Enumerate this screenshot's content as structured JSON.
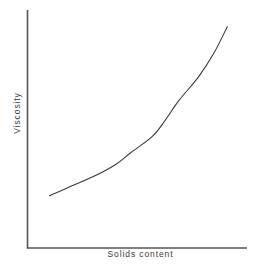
{
  "figure": {
    "background_color": "#ffffff",
    "axis_color": "#555555",
    "curve_color": "#3a3a3a",
    "label_color": "#3b3b3b"
  },
  "labels": {
    "y_axis": "Viscosity",
    "x_axis": "Solids content"
  },
  "chart_data": {
    "type": "line",
    "title": "",
    "subtitle": "",
    "xlabel": "Solids content",
    "ylabel": "Viscosity",
    "legend": [],
    "legend_position": "none",
    "grid": false,
    "axis_ticks": false,
    "tick_labels": [],
    "xlim": [
      0,
      1
    ],
    "ylim": [
      0,
      1
    ],
    "annotations": [],
    "series": [
      {
        "name": "Viscosity vs solids content",
        "x": [
          0.1,
          0.2,
          0.3,
          0.4,
          0.47,
          0.57,
          0.63,
          0.69,
          0.78,
          0.85,
          0.91
        ],
        "y": [
          0.22,
          0.26,
          0.3,
          0.35,
          0.4,
          0.47,
          0.54,
          0.62,
          0.72,
          0.82,
          0.93
        ]
      }
    ]
  }
}
